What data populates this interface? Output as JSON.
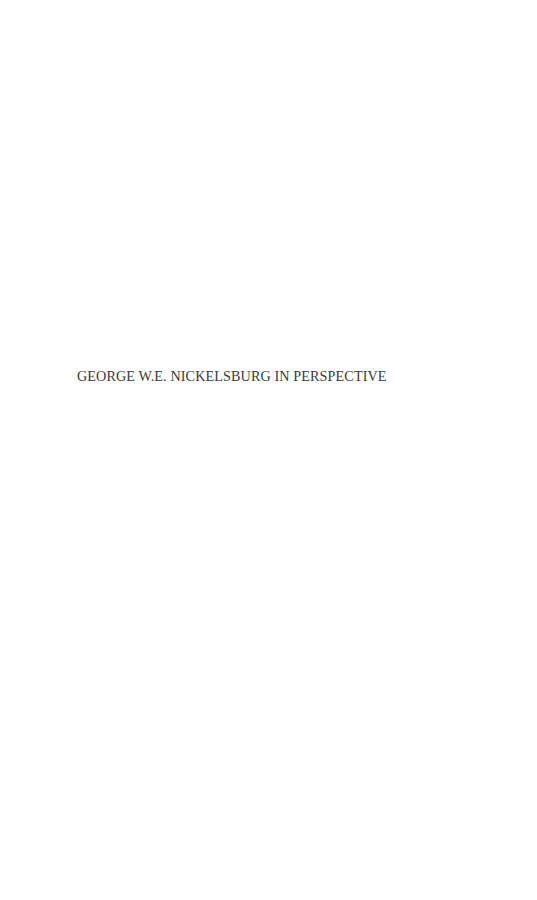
{
  "page": {
    "half_title": "GEORGE W.E. NICKELSBURG IN PERSPECTIVE"
  }
}
